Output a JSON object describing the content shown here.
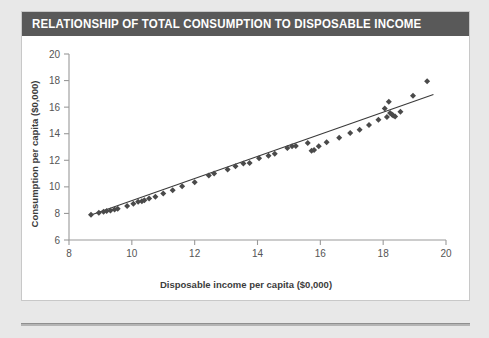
{
  "card": {
    "title": "RELATIONSHIP OF TOTAL CONSUMPTION TO DISPOSABLE INCOME",
    "title_bar_color": "#595959",
    "background_color": "#ffffff",
    "page_background_color": "#e8e8e8"
  },
  "chart_data": {
    "type": "scatter",
    "title": "RELATIONSHIP OF TOTAL CONSUMPTION TO DISPOSABLE INCOME",
    "xlabel": "Disposable income per capita ($0,000)",
    "ylabel": "Consumption per capita ($0,000)",
    "xlim": [
      8,
      20
    ],
    "ylim": [
      6,
      20
    ],
    "xticks": [
      8,
      10,
      12,
      14,
      16,
      18,
      20
    ],
    "yticks": [
      6,
      8,
      10,
      12,
      14,
      16,
      18,
      20
    ],
    "xtick_labels": [
      "8",
      "10",
      "12",
      "14",
      "16",
      "18",
      "20"
    ],
    "ytick_labels": [
      "6",
      "8",
      "10",
      "12",
      "14",
      "16",
      "18",
      "20"
    ],
    "grid": false,
    "legend": false,
    "marker": "diamond",
    "marker_color": "#4a4a4a",
    "line_color": "#3a3a3a",
    "axis_color": "#9a9a9a",
    "series": [
      {
        "name": "Consumption vs disposable income",
        "x": [
          8.7,
          8.95,
          9.1,
          9.2,
          9.32,
          9.45,
          9.55,
          9.85,
          10.05,
          10.2,
          10.32,
          10.4,
          10.55,
          10.75,
          11.0,
          11.3,
          11.6,
          12.0,
          12.45,
          12.62,
          13.05,
          13.3,
          13.55,
          13.75,
          14.05,
          14.35,
          14.55,
          14.95,
          15.1,
          15.22,
          15.6,
          15.72,
          15.8,
          15.95,
          16.2,
          16.6,
          16.95,
          17.25,
          17.55,
          17.85,
          18.05,
          18.12,
          18.18,
          18.22,
          18.28,
          18.32,
          18.38,
          18.55,
          18.95,
          19.4
        ],
        "y": [
          7.9,
          8.05,
          8.12,
          8.18,
          8.22,
          8.3,
          8.35,
          8.55,
          8.72,
          8.88,
          8.92,
          9.0,
          9.12,
          9.25,
          9.5,
          9.75,
          10.05,
          10.35,
          10.85,
          11.0,
          11.3,
          11.55,
          11.75,
          11.8,
          12.15,
          12.35,
          12.5,
          12.92,
          13.05,
          13.08,
          13.3,
          12.72,
          12.78,
          13.05,
          13.35,
          13.7,
          14.05,
          14.3,
          14.65,
          15.05,
          15.9,
          15.25,
          16.4,
          15.55,
          15.45,
          15.38,
          15.3,
          15.65,
          16.85,
          17.95
        ],
        "trend_line": {
          "x0": 8.7,
          "y0": 7.88,
          "x1": 19.6,
          "y1": 16.95
        }
      }
    ]
  }
}
